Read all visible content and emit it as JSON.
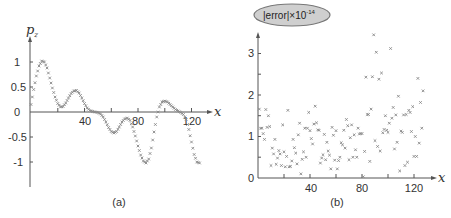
{
  "chart_data": [
    {
      "panel": "(a)",
      "type": "scatter",
      "title": "",
      "xlabel": "x",
      "ylabel": "p_z",
      "xlim": [
        0,
        130
      ],
      "ylim": [
        -1.5,
        1.5
      ],
      "xticks": [
        40,
        80,
        120
      ],
      "xtick_minor": [
        20,
        60,
        100
      ],
      "yticks": [
        1,
        0.5,
        0,
        -0.5,
        -1
      ],
      "ytick_labels": [
        "1",
        "0.5",
        "0",
        "-0.5",
        "-1"
      ],
      "grid": false,
      "marker": "x",
      "caption": "(a)",
      "series": [
        {
          "name": "p_z",
          "x": [
            0,
            2,
            4,
            6,
            8,
            10,
            12,
            14,
            16,
            18,
            20,
            22,
            24,
            26,
            28,
            30,
            32,
            34,
            36,
            38,
            40,
            42,
            44,
            46,
            48,
            50,
            52,
            54,
            56,
            58,
            60,
            62,
            64,
            66,
            68,
            70,
            72,
            74,
            76,
            78,
            80,
            82,
            84,
            86,
            88,
            90,
            92,
            94,
            96,
            98,
            100,
            102,
            104,
            106,
            108,
            110,
            112,
            114,
            116,
            118,
            120,
            122,
            124,
            126
          ],
          "y": [
            0.15,
            0.45,
            0.72,
            0.92,
            1.02,
            1.0,
            0.88,
            0.68,
            0.48,
            0.3,
            0.17,
            0.1,
            0.11,
            0.18,
            0.28,
            0.37,
            0.42,
            0.43,
            0.38,
            0.28,
            0.17,
            0.08,
            0.03,
            0.01,
            0.0,
            -0.01,
            -0.04,
            -0.1,
            -0.2,
            -0.31,
            -0.39,
            -0.42,
            -0.39,
            -0.3,
            -0.2,
            -0.14,
            -0.12,
            -0.17,
            -0.3,
            -0.48,
            -0.68,
            -0.86,
            -0.98,
            -1.02,
            -0.94,
            -0.72,
            -0.4,
            -0.1,
            0.1,
            0.2,
            0.22,
            0.2,
            0.15,
            0.1,
            0.05,
            0.02,
            -0.01,
            -0.05,
            -0.15,
            -0.35,
            -0.6,
            -0.85,
            -1.0,
            -1.02
          ]
        }
      ]
    },
    {
      "panel": "(b)",
      "type": "scatter",
      "title": "|error|×10^-14",
      "xlabel": "x",
      "ylabel": "|error|×10^-14",
      "xlim": [
        0,
        130
      ],
      "ylim": [
        0,
        3.6
      ],
      "xticks": [
        40,
        80,
        120
      ],
      "xtick_minor": [
        20,
        60,
        100
      ],
      "yticks": [
        0,
        1,
        2,
        3
      ],
      "ytick_minor": [
        0.5,
        1.5,
        2.5
      ],
      "grid": false,
      "marker": "x",
      "caption": "(b)",
      "series": [
        {
          "name": "|error|",
          "x": [
            1,
            2,
            3,
            4,
            5,
            6,
            7,
            8,
            9,
            10,
            11,
            12,
            13,
            14,
            15,
            16,
            17,
            18,
            19,
            20,
            21,
            22,
            23,
            24,
            25,
            26,
            27,
            28,
            29,
            30,
            31,
            32,
            33,
            34,
            35,
            36,
            37,
            38,
            39,
            40,
            41,
            42,
            43,
            44,
            45,
            46,
            47,
            48,
            49,
            50,
            51,
            52,
            53,
            54,
            55,
            56,
            57,
            58,
            59,
            60,
            61,
            62,
            63,
            64,
            65,
            66,
            67,
            68,
            69,
            70,
            71,
            72,
            73,
            74,
            75,
            76,
            77,
            78,
            79,
            80,
            81,
            82,
            83,
            84,
            85,
            86,
            87,
            88,
            89,
            90,
            91,
            92,
            93,
            94,
            95,
            96,
            97,
            98,
            99,
            100,
            101,
            102,
            103,
            104,
            105,
            106,
            107,
            108,
            109,
            110,
            111,
            112,
            113,
            114,
            115,
            116,
            117,
            118,
            119,
            120,
            121,
            122,
            123,
            124,
            125,
            126,
            127
          ],
          "y": [
            1.66,
            1.2,
            1.2,
            1.07,
            0.93,
            1.65,
            1.22,
            1.5,
            1.24,
            0.3,
            0.72,
            0.58,
            0.93,
            0.33,
            0.48,
            0.66,
            0.58,
            0.3,
            1.28,
            0.63,
            0.27,
            0.52,
            1.63,
            0.27,
            0.28,
            0.41,
            0.93,
            0.73,
            0.6,
            0.34,
            1.04,
            1.32,
            0.1,
            0.45,
            0.63,
            1.2,
            0.5,
            1.2,
            1.58,
            1.14,
            0.95,
            0.82,
            1.3,
            1.73,
            1.33,
            1.16,
            1.15,
            0.36,
            0.48,
            0.56,
            1.05,
            0.44,
            0.86,
            0.65,
            0.55,
            0.22,
            1.22,
            1.03,
            0.43,
            1.14,
            0.22,
            0.42,
            0.5,
            0.85,
            0.8,
            1.15,
            0.72,
            1.41,
            1.26,
            0.44,
            0.97,
            1.28,
            0.5,
            1.04,
            0.68,
            0.5,
            1.2,
            1.06,
            1.07,
            1.07,
            0.03,
            0.64,
            2.43,
            1.53,
            1.53,
            0.4,
            1.66,
            2.44,
            3.45,
            0.9,
            3.03,
            0.76,
            2.38,
            0.65,
            2.53,
            1.09,
            1.17,
            1.5,
            1.15,
            1.1,
            1.32,
            3.12,
            1.44,
            1.7,
            0.7,
            1.52,
            0.86,
            1.97,
            0.17,
            1.13,
            1.1,
            1.52,
            0.3,
            1.53,
            0.38,
            1.63,
            1.58,
            1.12,
            1.72,
            0.52,
            1.0,
            0.52,
            2.4,
            0.84,
            1.82,
            1.2,
            2.1
          ]
        }
      ]
    }
  ],
  "panels": {
    "a": {
      "caption": "(a)",
      "ylabel_main": "p",
      "ylabel_sub": "z",
      "xlabel": "x",
      "xtick_labels": [
        "40",
        "80",
        "120"
      ],
      "ytick_labels": [
        "1",
        "0.5",
        "0",
        "-0.5",
        "-1"
      ]
    },
    "b": {
      "caption": "(b)",
      "title_main": "|error|×10",
      "title_sup": "-14",
      "xlabel": "x",
      "xtick_labels": [
        "40",
        "80",
        "120"
      ],
      "ytick_labels": [
        "0",
        "1",
        "2",
        "3"
      ]
    }
  },
  "colors": {
    "marker": "#888888",
    "axis": "#555555",
    "text": "#333333",
    "title_fill": "#cfcfcf"
  }
}
